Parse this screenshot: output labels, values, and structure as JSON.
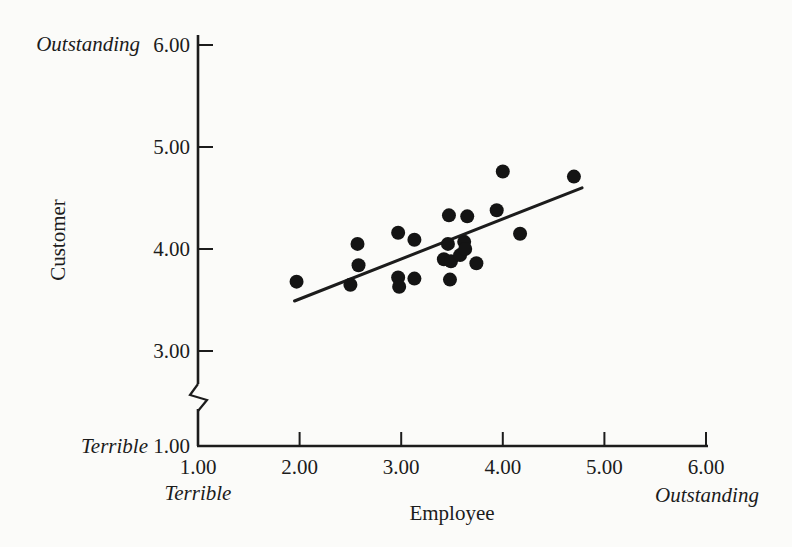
{
  "figure": {
    "background": "#fbfbf9"
  },
  "chart_data": {
    "type": "scatter",
    "title": "",
    "xlabel": "Employee",
    "ylabel": "Customer",
    "x_axis": {
      "tick_labels": [
        "1.00",
        "2.00",
        "3.00",
        "4.00",
        "5.00",
        "6.00"
      ],
      "tick_values": [
        1,
        2,
        3,
        4,
        5,
        6
      ],
      "range": [
        1,
        6
      ],
      "min_qualifier": "Terrible",
      "max_qualifier": "Outstanding",
      "grid": false
    },
    "y_axis": {
      "tick_labels": [
        "1.00",
        "3.00",
        "4.00",
        "5.00",
        "6.00"
      ],
      "tick_values": [
        1,
        3,
        4,
        5,
        6
      ],
      "range": [
        1,
        6
      ],
      "axis_break_between": [
        1,
        3
      ],
      "min_qualifier": "Terrible",
      "max_qualifier": "Outstanding",
      "grid": false
    },
    "points": [
      [
        1.97,
        3.68
      ],
      [
        2.5,
        3.65
      ],
      [
        2.57,
        4.05
      ],
      [
        2.58,
        3.84
      ],
      [
        2.97,
        4.16
      ],
      [
        2.97,
        3.72
      ],
      [
        2.98,
        3.63
      ],
      [
        3.13,
        4.09
      ],
      [
        3.13,
        3.71
      ],
      [
        3.42,
        3.9
      ],
      [
        3.46,
        4.05
      ],
      [
        3.47,
        4.33
      ],
      [
        3.48,
        3.7
      ],
      [
        3.49,
        3.88
      ],
      [
        3.58,
        3.94
      ],
      [
        3.62,
        4.07
      ],
      [
        3.63,
        4.0
      ],
      [
        3.65,
        4.32
      ],
      [
        3.74,
        3.86
      ],
      [
        3.94,
        4.38
      ],
      [
        4.0,
        4.76
      ],
      [
        4.17,
        4.15
      ],
      [
        4.7,
        4.71
      ]
    ],
    "trendline": {
      "x1": 1.95,
      "y1": 3.49,
      "x2": 4.78,
      "y2": 4.6
    },
    "dot_color": "#141414",
    "line_color": "#1c1c1c",
    "axis_color": "#1c1c1c",
    "text_color": "#1c1c1c"
  }
}
